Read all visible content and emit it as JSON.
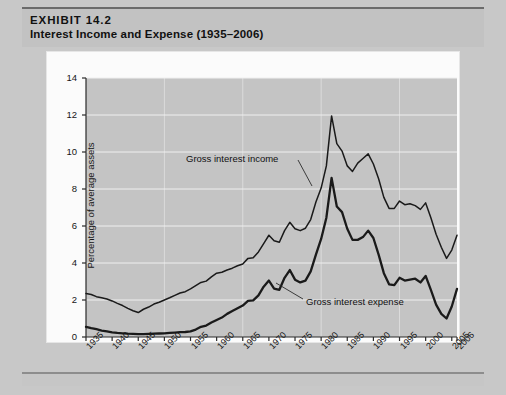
{
  "exhibit": {
    "number_label": "EXHIBIT 14.2",
    "title": "Interest Income and Expense (1935–2006)"
  },
  "colors": {
    "plot_background": "#c4c4c4",
    "gridline": "#efefef",
    "line": "#1a1a1a",
    "banner": "#c2c2c2",
    "page_background": "#c8c8c8",
    "card": "#fbfbfb"
  },
  "annotations": {
    "income_label": "Gross interest income",
    "expense_label": "Gross interest expense"
  },
  "chart_data": {
    "type": "line",
    "title": "Interest Income and Expense (1935–2006)",
    "xlabel": "Year",
    "ylabel": "Percentage of average assets",
    "xlim": [
      1935,
      2006
    ],
    "ylim": [
      0,
      14
    ],
    "ytick_labels": [
      "0",
      "2",
      "4",
      "6",
      "8",
      "10",
      "12",
      "14"
    ],
    "ytick_values": [
      0,
      2,
      4,
      6,
      8,
      10,
      12,
      14
    ],
    "xtick_labels": [
      "1935",
      "1940",
      "1945",
      "1950",
      "1955",
      "1960",
      "1965",
      "1970",
      "1975",
      "1980",
      "1985",
      "1990",
      "1995",
      "2000",
      "2005",
      "2006"
    ],
    "xtick_values": [
      1935,
      1940,
      1945,
      1950,
      1955,
      1960,
      1965,
      1970,
      1975,
      1980,
      1985,
      1990,
      1995,
      2000,
      2005,
      2006
    ],
    "grid": "horizontal",
    "legend": "annotated-inline",
    "x": [
      1935,
      1936,
      1937,
      1938,
      1939,
      1940,
      1941,
      1942,
      1943,
      1944,
      1945,
      1946,
      1947,
      1948,
      1949,
      1950,
      1951,
      1952,
      1953,
      1954,
      1955,
      1956,
      1957,
      1958,
      1959,
      1960,
      1961,
      1962,
      1963,
      1964,
      1965,
      1966,
      1967,
      1968,
      1969,
      1970,
      1971,
      1972,
      1973,
      1974,
      1975,
      1976,
      1977,
      1978,
      1979,
      1980,
      1981,
      1982,
      1983,
      1984,
      1985,
      1986,
      1987,
      1988,
      1989,
      1990,
      1991,
      1992,
      1993,
      1994,
      1995,
      1996,
      1997,
      1998,
      1999,
      2000,
      2001,
      2002,
      2003,
      2004,
      2005,
      2006
    ],
    "series": [
      {
        "name": "Gross interest income",
        "values": [
          2.35,
          2.3,
          2.18,
          2.12,
          2.05,
          1.95,
          1.82,
          1.7,
          1.55,
          1.42,
          1.32,
          1.5,
          1.62,
          1.78,
          1.88,
          2.0,
          2.12,
          2.25,
          2.38,
          2.45,
          2.6,
          2.78,
          2.95,
          3.02,
          3.25,
          3.45,
          3.5,
          3.62,
          3.72,
          3.85,
          3.95,
          4.25,
          4.28,
          4.6,
          5.05,
          5.5,
          5.2,
          5.12,
          5.75,
          6.2,
          5.85,
          5.75,
          5.88,
          6.35,
          7.3,
          8.05,
          9.25,
          11.95,
          10.45,
          10.05,
          9.25,
          8.95,
          9.4,
          9.65,
          9.9,
          9.35,
          8.55,
          7.55,
          6.95,
          6.95,
          7.35,
          7.15,
          7.2,
          7.1,
          6.9,
          7.25,
          6.45,
          5.55,
          4.85,
          4.25,
          4.7,
          5.5
        ]
      },
      {
        "name": "Gross interest expense",
        "values": [
          0.55,
          0.48,
          0.42,
          0.35,
          0.3,
          0.25,
          0.22,
          0.2,
          0.18,
          0.17,
          0.16,
          0.16,
          0.17,
          0.18,
          0.19,
          0.2,
          0.22,
          0.24,
          0.26,
          0.27,
          0.3,
          0.4,
          0.55,
          0.62,
          0.78,
          0.92,
          1.05,
          1.25,
          1.4,
          1.55,
          1.7,
          1.95,
          1.98,
          2.25,
          2.72,
          3.05,
          2.62,
          2.55,
          3.2,
          3.62,
          3.1,
          2.95,
          3.05,
          3.55,
          4.45,
          5.3,
          6.45,
          8.6,
          7.05,
          6.75,
          5.85,
          5.25,
          5.25,
          5.4,
          5.75,
          5.35,
          4.45,
          3.45,
          2.85,
          2.8,
          3.2,
          3.05,
          3.1,
          3.15,
          2.95,
          3.3,
          2.55,
          1.75,
          1.25,
          1.0,
          1.65,
          2.6
        ]
      }
    ]
  }
}
